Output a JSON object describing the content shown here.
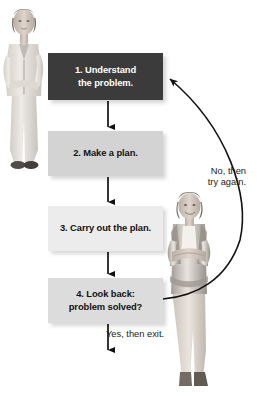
{
  "diagram": {
    "steps": [
      {
        "id": "step-1",
        "label": "1. Understand\nthe problem.",
        "fill": "#3b3b3b",
        "text_color": "#ffffff"
      },
      {
        "id": "step-2",
        "label": "2. Make a plan.",
        "fill": "#d3d3d3",
        "text_color": "#121212"
      },
      {
        "id": "step-3",
        "label": "3. Carry out the plan.",
        "fill": "#ececec",
        "text_color": "#121212"
      },
      {
        "id": "step-4",
        "label": "4. Look back:\nproblem solved?",
        "fill": "#dcdcdc",
        "text_color": "#121212"
      }
    ],
    "edge_labels": {
      "feedback": "No, then\ntry again.",
      "exit": "Yes, then exit."
    },
    "figures": {
      "left": "woman-thinking-photo",
      "right": "woman-arms-crossed-photo"
    },
    "line_color": "#000000"
  }
}
